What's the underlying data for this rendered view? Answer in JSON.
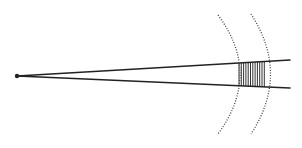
{
  "diagram": {
    "type": "diverging-rays-through-wavefronts",
    "stroke_color": "#222222",
    "hatch_color": "#333333",
    "source_point": {
      "x": 17,
      "y": 76
    },
    "rays": [
      {
        "name": "upper-ray",
        "x1": 17,
        "y1": 76,
        "x2": 290,
        "y2": 60
      },
      {
        "name": "lower-ray",
        "x1": 17,
        "y1": 76,
        "x2": 290,
        "y2": 88
      }
    ],
    "wavefronts": [
      {
        "name": "inner-wavefront",
        "style": "dotted",
        "path": "M 218 15 Q 262 74 218 134"
      },
      {
        "name": "outer-wavefront",
        "style": "dotted",
        "path": "M 251 14 Q 290 74 251 134"
      }
    ],
    "hatched_region": {
      "x_start": 239,
      "x_end": 265,
      "line_spacing": 2.3
    }
  }
}
